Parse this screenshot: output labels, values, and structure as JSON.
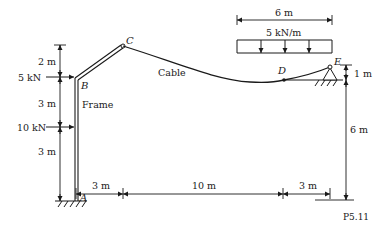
{
  "figure": {
    "id_label": "P5.11",
    "nodes": {
      "A": "A",
      "B": "B",
      "C": "C",
      "D": "D",
      "E": "E"
    },
    "member_labels": {
      "frame": "Frame",
      "cable": "Cable"
    },
    "loads": {
      "point_load_B": "5 kN",
      "point_load_mid": "10 kN",
      "distributed": "5 kN/m"
    },
    "dimensions": {
      "left_top": "2 m",
      "left_mid": "3 m",
      "left_bottom": "3 m",
      "bottom_1": "3 m",
      "bottom_2": "10 m",
      "bottom_3": "3 m",
      "load_span": "6 m",
      "right_top": "1 m",
      "right_bottom": "6 m"
    },
    "colors": {
      "ink": "#1a1a1a",
      "background": "#ffffff"
    }
  }
}
